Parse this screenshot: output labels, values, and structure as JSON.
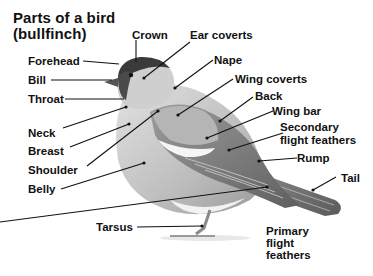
{
  "title": {
    "line1": "Parts of a bird",
    "line2": "(bullfinch)"
  },
  "labels": {
    "crown": "Crown",
    "ear_coverts": "Ear coverts",
    "forehead": "Forehead",
    "nape": "Nape",
    "bill": "Bill",
    "wing_coverts": "Wing coverts",
    "throat": "Throat",
    "back": "Back",
    "wing_bar": "Wing bar",
    "neck": "Neck",
    "secondary_1": "Secondary",
    "secondary_2": "flight feathers",
    "breast": "Breast",
    "shoulder": "Shoulder",
    "rump": "Rump",
    "belly": "Belly",
    "tail": "Tail",
    "tarsus": "Tarsus",
    "primary_1": "Primary",
    "primary_2": "flight",
    "primary_3": "feathers"
  },
  "colors": {
    "background": "#ffffff",
    "text": "#111111",
    "cap": "#3a3a3a",
    "body_light": "#d4d4d4",
    "body_mid": "#a9a9a9",
    "wing_dark": "#6e6e6e"
  }
}
